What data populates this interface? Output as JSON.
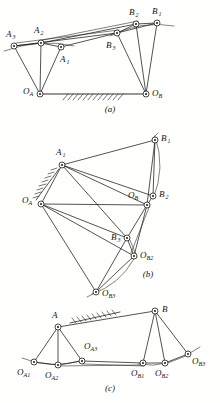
{
  "figure": {
    "background_color": "#fffffd",
    "ink_color": "#1a1a18",
    "panels": [
      {
        "id": "a",
        "caption": "(a)",
        "caption_pos": [
          110,
          112
        ],
        "joints": [
          {
            "name": "A3",
            "label": "A",
            "sub": "3",
            "x": 14,
            "y": 46,
            "label_x": 6,
            "label_y": 37,
            "sub_dx": 6.6,
            "sub_dy": 2.4
          },
          {
            "name": "A2",
            "label": "A",
            "sub": "2",
            "x": 41,
            "y": 43,
            "label_x": 34,
            "label_y": 33,
            "sub_dx": 6.6,
            "sub_dy": 2.4
          },
          {
            "name": "A1",
            "label": "A",
            "sub": "1",
            "x": 61,
            "y": 47,
            "label_x": 60,
            "label_y": 62,
            "sub_dx": 6.6,
            "sub_dy": 2.4
          },
          {
            "name": "B3",
            "label": "B",
            "sub": "3",
            "x": 117,
            "y": 33,
            "label_x": 106,
            "label_y": 48,
            "sub_dx": 6.4,
            "sub_dy": 2.4
          },
          {
            "name": "B2",
            "label": "B",
            "sub": "2",
            "x": 136,
            "y": 24,
            "label_x": 129,
            "label_y": 15,
            "sub_dx": 6.4,
            "sub_dy": 2.4
          },
          {
            "name": "B1",
            "label": "B",
            "sub": "1",
            "x": 157,
            "y": 23,
            "label_x": 152,
            "label_y": 14,
            "sub_dx": 6.4,
            "sub_dy": 2.4
          },
          {
            "name": "OA",
            "label": "O",
            "sub": "A",
            "x": 40,
            "y": 94,
            "label_x": 23,
            "label_y": 94,
            "sub_dx": 6.6,
            "sub_dy": 2.4
          },
          {
            "name": "OB",
            "label": "O",
            "sub": "B",
            "x": 146,
            "y": 94,
            "label_x": 152,
            "label_y": 96,
            "sub_dx": 6.6,
            "sub_dy": 2.4
          }
        ],
        "links": [
          [
            "OA",
            "A3"
          ],
          [
            "OA",
            "A2"
          ],
          [
            "OA",
            "A1"
          ],
          [
            "OB",
            "B3"
          ],
          [
            "OB",
            "B2"
          ],
          [
            "OB",
            "B1"
          ],
          [
            "A3",
            "A2"
          ],
          [
            "A2",
            "A1"
          ],
          [
            "B3",
            "B2"
          ],
          [
            "B2",
            "B1"
          ],
          [
            "A3",
            "B3"
          ],
          [
            "A2",
            "B2"
          ],
          [
            "A1",
            "B1"
          ]
        ],
        "ground": {
          "from": [
            40,
            94
          ],
          "to": [
            146,
            94
          ],
          "hatch_from_x": 62,
          "hatch_to_x": 120
        },
        "arcs": [
          {
            "from": "A3",
            "to": "A1",
            "tail_left": [
              4,
              51
            ],
            "tail_right": [
              74,
              47
            ]
          },
          {
            "from": "B3",
            "to": "B1",
            "tail_right": [
              172,
              26
            ]
          }
        ]
      },
      {
        "id": "b",
        "caption": "(b)",
        "caption_pos": [
          148,
          277
        ],
        "joints": [
          {
            "name": "A1",
            "label": "A",
            "sub": "1",
            "x": 62,
            "y": 165,
            "label_x": 56,
            "label_y": 155,
            "sub_dx": 6.6,
            "sub_dy": 2.4
          },
          {
            "name": "B1",
            "label": "B",
            "sub": "1",
            "x": 155,
            "y": 140,
            "label_x": 161,
            "label_y": 141,
            "sub_dx": 6.4,
            "sub_dy": 2.4
          },
          {
            "name": "OA",
            "label": "O",
            "sub": "A",
            "x": 41,
            "y": 204,
            "label_x": 22,
            "label_y": 203,
            "sub_dx": 6.6,
            "sub_dy": 2.4
          },
          {
            "name": "OB",
            "label": "O",
            "sub": "B",
            "x": 147,
            "y": 205,
            "label_x": 128,
            "label_y": 198,
            "sub_dx": 6.6,
            "sub_dy": 2.4
          },
          {
            "name": "B2",
            "label": "B",
            "sub": "2",
            "x": 153,
            "y": 196,
            "label_x": 159,
            "label_y": 197,
            "sub_dx": 6.4,
            "sub_dy": 2.4
          },
          {
            "name": "B3",
            "label": "B",
            "sub": "3",
            "x": 127,
            "y": 238,
            "label_x": 111,
            "label_y": 240,
            "sub_dx": 6.4,
            "sub_dy": 2.4
          },
          {
            "name": "OB2",
            "label": "O",
            "sub": "B2",
            "x": 134,
            "y": 256,
            "label_x": 140,
            "label_y": 258,
            "sub_dx": 6.6,
            "sub_dy": 2.4
          },
          {
            "name": "OB3",
            "label": "O",
            "sub": "B3",
            "x": 96,
            "y": 292,
            "label_x": 102,
            "label_y": 296,
            "sub_dx": 6.6,
            "sub_dy": 2.4
          }
        ],
        "links": [
          [
            "OA",
            "A1"
          ],
          [
            "A1",
            "B1"
          ],
          [
            "B1",
            "OB"
          ],
          [
            "OA",
            "OB"
          ],
          [
            "A1",
            "OB"
          ],
          [
            "A1",
            "B2"
          ],
          [
            "A1",
            "B3"
          ],
          [
            "OA",
            "B3"
          ],
          [
            "OA",
            "OB2"
          ],
          [
            "OA",
            "OB3"
          ],
          [
            "B1",
            "B2"
          ],
          [
            "B2",
            "OB"
          ],
          [
            "OB",
            "B3"
          ],
          [
            "B3",
            "OB2"
          ],
          [
            "OB",
            "OB2"
          ],
          [
            "OB2",
            "OB3"
          ],
          [
            "B3",
            "OB3"
          ]
        ],
        "hatch_wall": {
          "x1": 36,
          "y1": 196,
          "x2": 58,
          "y2": 168
        },
        "arcs": [
          {
            "from": "B1",
            "to": "B2",
            "bulge": 7
          },
          {
            "from": "B3",
            "to": "OB2",
            "bulge": 3
          },
          {
            "from": "OB2",
            "to": "OB3",
            "bulge": 9
          }
        ]
      },
      {
        "id": "c",
        "caption": "(c)",
        "caption_pos": [
          110,
          391
        ],
        "joints": [
          {
            "name": "A",
            "label": "A",
            "sub": "",
            "x": 58,
            "y": 327,
            "label_x": 52,
            "label_y": 318,
            "sub_dx": 6.4,
            "sub_dy": 2.4
          },
          {
            "name": "B",
            "label": "B",
            "sub": "",
            "x": 155,
            "y": 311,
            "label_x": 162,
            "label_y": 312,
            "sub_dx": 6.4,
            "sub_dy": 2.4
          },
          {
            "name": "OA1",
            "label": "O",
            "sub": "A1",
            "x": 34,
            "y": 362,
            "label_x": 17,
            "label_y": 375,
            "sub_dx": 6.6,
            "sub_dy": 2.4
          },
          {
            "name": "OA2",
            "label": "O",
            "sub": "A2",
            "x": 58,
            "y": 365,
            "label_x": 45,
            "label_y": 378,
            "sub_dx": 6.6,
            "sub_dy": 2.4
          },
          {
            "name": "OA3",
            "label": "O",
            "sub": "A3",
            "x": 82,
            "y": 361,
            "label_x": 84,
            "label_y": 349,
            "sub_dx": 6.6,
            "sub_dy": 2.4
          },
          {
            "name": "OB1",
            "label": "O",
            "sub": "B1",
            "x": 143,
            "y": 363,
            "label_x": 131,
            "label_y": 376,
            "sub_dx": 6.6,
            "sub_dy": 2.4
          },
          {
            "name": "OB2",
            "label": "O",
            "sub": "B2",
            "x": 165,
            "y": 363,
            "label_x": 155,
            "label_y": 376,
            "sub_dx": 6.6,
            "sub_dy": 2.4
          },
          {
            "name": "OB3",
            "label": "O",
            "sub": "B3",
            "x": 188,
            "y": 354,
            "label_x": 192,
            "label_y": 364,
            "sub_dx": 6.6,
            "sub_dy": 2.4
          }
        ],
        "links": [
          [
            "A",
            "OA1"
          ],
          [
            "A",
            "OA2"
          ],
          [
            "A",
            "OA3"
          ],
          [
            "B",
            "OB1"
          ],
          [
            "B",
            "OB2"
          ],
          [
            "B",
            "OB3"
          ],
          [
            "A",
            "B"
          ],
          [
            "OA1",
            "OA2"
          ],
          [
            "OA2",
            "OA3"
          ],
          [
            "OB1",
            "OB2"
          ],
          [
            "OB2",
            "OB3"
          ],
          [
            "OA3",
            "OB1"
          ],
          [
            "OA2",
            "OB1"
          ]
        ],
        "ground_hatch": {
          "x1": 72,
          "y1": 322,
          "x2": 118,
          "y2": 312
        },
        "arcs": [
          {
            "from": "OA1",
            "to": "OA3",
            "tail_left": [
              22,
              358
            ],
            "bulge": 3
          },
          {
            "from": "OB1",
            "to": "OB3",
            "tail_right": [
              200,
              348
            ],
            "bulge": 4
          }
        ]
      }
    ]
  }
}
